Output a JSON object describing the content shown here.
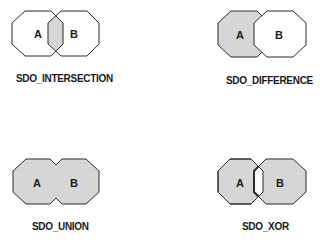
{
  "colors": {
    "fill": "#d6d6d6",
    "stroke": "#2a2a2a",
    "background": "#ffffff"
  },
  "panels": [
    {
      "id": "intersection",
      "caption": "SDO_INTERSECTION",
      "label_a": "A",
      "label_b": "B",
      "shaded": "overlap only"
    },
    {
      "id": "difference",
      "caption": "SDO_DIFFERENCE",
      "label_a": "A",
      "label_b": "B",
      "shaded": "A minus B"
    },
    {
      "id": "union",
      "caption": "SDO_UNION",
      "label_a": "A",
      "label_b": "B",
      "shaded": "A or B"
    },
    {
      "id": "xor",
      "caption": "SDO_XOR",
      "label_a": "A",
      "label_b": "B",
      "shaded": "A xor B"
    }
  ]
}
